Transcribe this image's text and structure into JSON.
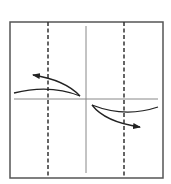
{
  "diagram": {
    "type": "origami-fold-instruction",
    "canvas": {
      "width": 171,
      "height": 184,
      "background": "#ffffff"
    },
    "colors": {
      "frame": "#555555",
      "crease": "#888888",
      "dashed": "#333333",
      "arrow": "#222222"
    },
    "paper_square": {
      "x1": 10,
      "y1": 22,
      "x2": 163,
      "y2": 178
    },
    "creases": {
      "vertical_center": {
        "x": 86,
        "y1": 26,
        "y2": 173
      },
      "horizontal_center": {
        "y": 99,
        "x1": 14,
        "x2": 158
      }
    },
    "valley_fold_lines": [
      {
        "name": "left-dashed-fold",
        "x": 48,
        "y1": 22,
        "y2": 178
      },
      {
        "name": "right-dashed-fold",
        "x": 124,
        "y1": 22,
        "y2": 178
      }
    ],
    "flaps": [
      {
        "name": "upper-left-flap-edge",
        "from": [
          14,
          93
        ],
        "ctrl": [
          50,
          84
        ],
        "to": [
          80,
          96
        ]
      },
      {
        "name": "lower-right-flap-edge",
        "from": [
          92,
          105
        ],
        "ctrl": [
          125,
          118
        ],
        "to": [
          158,
          107
        ]
      }
    ],
    "arrows": [
      {
        "name": "upper-left-arrow",
        "direction": "left",
        "from": [
          80,
          96
        ],
        "ctrl": [
          65,
          80
        ],
        "to": [
          33,
          75
        ]
      },
      {
        "name": "lower-right-arrow",
        "direction": "right",
        "from": [
          92,
          105
        ],
        "ctrl": [
          105,
          122
        ],
        "to": [
          140,
          127
        ]
      }
    ]
  }
}
